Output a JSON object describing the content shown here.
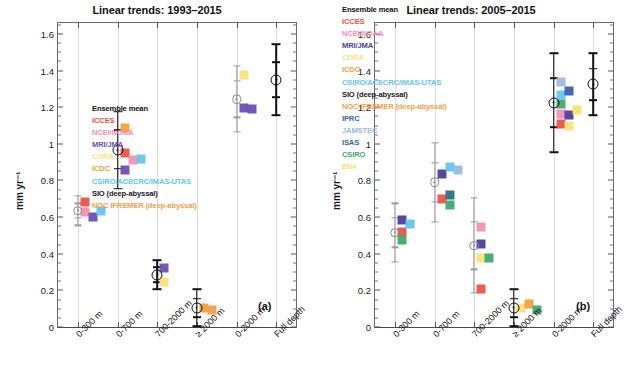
{
  "figure": {
    "ylabel": "mm yr⁻¹",
    "ymin": 0,
    "ymax": 1.66,
    "yticks": [
      "0",
      "0.2",
      "0.4",
      "0.6",
      "0.8",
      "1",
      "1.2",
      "1.4",
      "1.6"
    ],
    "ytick_values": [
      0,
      0.2,
      0.4,
      0.6,
      0.8,
      1.0,
      1.2,
      1.4,
      1.6
    ],
    "categories": [
      "0-300 m",
      "0-700 m",
      "700-2000 m",
      "≥ 2000 m",
      "0-2000 m",
      "Full depth"
    ]
  },
  "palette": {
    "ensemble_mean": "#111111",
    "ICCES": "#e8544a",
    "NCEI_NOAA": "#f48fb4",
    "MRI_JMA": "#6b4fb5",
    "CORA": "#fbe27a",
    "ICDC": "#f2a13c",
    "CSIRO_ACECRC_IMAS_UTAS": "#63c6ee",
    "SIO_deep_abyssal": "#1a1a1a",
    "NOC_IFREMER_deep_abyssal": "#f2a04a",
    "IPRC": "#3b5fae",
    "JAMSTEC": "#9cb9df",
    "ISAS": "#2f6f7e",
    "CSIRO": "#3faa6e",
    "EN4": "#f7e26b"
  },
  "panels": [
    {
      "tag": "(a)",
      "title": "Linear trends: 1993–2015",
      "legend": [
        {
          "label": "Ensemble mean",
          "color": "#111111"
        },
        {
          "label": "ICCES",
          "color": "#e8544a"
        },
        {
          "label": "NCEI/NOAA",
          "color": "#f48fb4"
        },
        {
          "label": "MRI/JMA",
          "color": "#6b4fb5"
        },
        {
          "label": "CORA",
          "color": "#fbe27a"
        },
        {
          "label": "ICDC",
          "color": "#f2a13c"
        },
        {
          "label": "CSIRO/ACECRC/IMAS-UTAS",
          "color": "#63c6ee"
        },
        {
          "label": "SIO (deep-abyssal)",
          "color": "#1a1a1a"
        },
        {
          "label": "NOC IFREMER (deep-abyssal)",
          "color": "#f2a04a"
        }
      ],
      "chart_data": {
        "type": "scatter",
        "title": "Linear trends: 1993–2015",
        "xlabel": "",
        "ylabel": "mm yr⁻¹",
        "ylim": [
          0,
          1.66
        ],
        "grid": true,
        "categories": [
          "0-300 m",
          "0-700 m",
          "700-2000 m",
          "≥ 2000 m",
          "0-2000 m",
          "Full depth"
        ],
        "ensemble_mean": [
          0.635,
          0.965,
          0.285,
          0.105,
          1.245,
          1.35
        ],
        "error_low": [
          0.555,
          0.755,
          0.205,
          0.005,
          1.065,
          1.155
        ],
        "error_high": [
          0.715,
          1.175,
          0.365,
          0.205,
          1.425,
          1.545
        ],
        "inner_low": [
          0.595,
          0.865,
          0.245,
          0.055,
          1.145,
          1.255
        ],
        "inner_high": [
          0.675,
          1.075,
          0.325,
          0.155,
          1.345,
          1.445
        ],
        "error_style": [
          "gray",
          "black",
          "black",
          "black",
          "gray",
          "black"
        ],
        "members": [
          {
            "name": "ICCES",
            "color": "#e8544a",
            "values": [
              0.68,
              0.95,
              null,
              null,
              null,
              null
            ]
          },
          {
            "name": "NCEI/NOAA",
            "color": "#f48fb4",
            "values": [
              0.63,
              0.91,
              null,
              null,
              null,
              null
            ]
          },
          {
            "name": "MRI/JMA",
            "color": "#6b4fb5",
            "values": [
              0.6,
              0.855,
              0.32,
              null,
              1.195,
              null
            ]
          },
          {
            "name": "CORA",
            "color": "#fbe27a",
            "values": [
              null,
              null,
              0.245,
              null,
              1.375,
              null
            ]
          },
          {
            "name": "ICDC",
            "color": "#f2a13c",
            "values": [
              null,
              1.085,
              null,
              0.105,
              null,
              null
            ]
          },
          {
            "name": "CSIRO/ACECRC/IMAS-UTAS",
            "color": "#63c6ee",
            "values": [
              0.635,
              0.915,
              null,
              null,
              null,
              null
            ]
          },
          {
            "name": "NOC IFREMER (deep-abyssal)",
            "color": "#f2a04a",
            "values": [
              null,
              null,
              null,
              0.095,
              null,
              null
            ]
          },
          {
            "name": "SIO (deep-abyssal)",
            "color": "#6b4fb5",
            "values": [
              null,
              null,
              null,
              null,
              1.19,
              null
            ]
          }
        ]
      }
    },
    {
      "tag": "(b)",
      "title": "Linear trends: 2005–2015",
      "legend": [
        {
          "label": "Ensemble mean",
          "color": "#111111"
        },
        {
          "label": "ICCES",
          "color": "#e8544a"
        },
        {
          "label": "NCEI/NOAA",
          "color": "#f48fb4"
        },
        {
          "label": "MRI/JMA",
          "color": "#4a3f9e"
        },
        {
          "label": "CORA",
          "color": "#fbe27a"
        },
        {
          "label": "ICDC",
          "color": "#f2a13c"
        },
        {
          "label": "CSIRO/ACECRC/IMAS-UTAS",
          "color": "#63c6ee"
        },
        {
          "label": "SIO (deep-abyssal)",
          "color": "#1a1a1a"
        },
        {
          "label": "NOC IFREMER (deep-abyssal)",
          "color": "#f2a04a"
        },
        {
          "label": "IPRC",
          "color": "#3b5fae"
        },
        {
          "label": "JAMSTEC",
          "color": "#9cb9df"
        },
        {
          "label": "ISAS",
          "color": "#2f6f7e"
        },
        {
          "label": "CSIRO",
          "color": "#3faa6e"
        },
        {
          "label": "EN4",
          "color": "#f7e26b"
        }
      ],
      "chart_data": {
        "type": "scatter",
        "title": "Linear trends: 2005–2015",
        "xlabel": "",
        "ylabel": "mm yr⁻¹",
        "ylim": [
          0,
          1.66
        ],
        "grid": true,
        "categories": [
          "0-300 m",
          "0-700 m",
          "700-2000 m",
          "≥ 2000 m",
          "0-2000 m",
          "Full depth"
        ],
        "ensemble_mean": [
          0.515,
          0.79,
          0.445,
          0.105,
          1.225,
          1.325
        ],
        "error_low": [
          0.355,
          0.575,
          0.185,
          0.005,
          0.955,
          1.155
        ],
        "error_high": [
          0.675,
          1.005,
          0.705,
          0.205,
          1.495,
          1.495
        ],
        "inner_low": [
          0.435,
          0.685,
          0.315,
          0.055,
          1.09,
          1.24
        ],
        "inner_high": [
          0.595,
          0.895,
          0.575,
          0.155,
          1.36,
          1.41
        ],
        "error_style": [
          "gray",
          "gray",
          "gray",
          "black",
          "black",
          "black"
        ],
        "members": [
          {
            "name": "ICCES",
            "color": "#e8544a",
            "values": [
              0.52,
              0.7,
              0.21,
              null,
              1.11,
              null
            ]
          },
          {
            "name": "NCEI/NOAA",
            "color": "#f48fb4",
            "values": [
              null,
              null,
              0.545,
              null,
              1.165,
              null
            ]
          },
          {
            "name": "MRI/JMA",
            "color": "#4a3f9e",
            "values": [
              0.585,
              0.835,
              0.455,
              null,
              1.16,
              null
            ]
          },
          {
            "name": "CORA",
            "color": "#fbe27a",
            "values": [
              null,
              null,
              0.375,
              0.105,
              1.095,
              null
            ]
          },
          {
            "name": "ICDC",
            "color": "#f2a13c",
            "values": [
              null,
              null,
              null,
              0.125,
              null,
              null
            ]
          },
          {
            "name": "CSIRO/ACECRC/IMAS-UTAS",
            "color": "#63c6ee",
            "values": [
              0.565,
              0.875,
              null,
              null,
              1.265,
              null
            ]
          },
          {
            "name": "IPRC",
            "color": "#3b5fae",
            "values": [
              null,
              null,
              null,
              null,
              1.29,
              null
            ]
          },
          {
            "name": "JAMSTEC",
            "color": "#9cb9df",
            "values": [
              null,
              0.855,
              null,
              null,
              1.34,
              null
            ]
          },
          {
            "name": "ISAS",
            "color": "#2f6f7e",
            "values": [
              null,
              0.72,
              null,
              null,
              null,
              null
            ]
          },
          {
            "name": "CSIRO",
            "color": "#3faa6e",
            "values": [
              0.475,
              0.665,
              0.375,
              0.095,
              1.215,
              null
            ]
          },
          {
            "name": "EN4",
            "color": "#f7e26b",
            "values": [
              null,
              null,
              null,
              null,
              1.185,
              null
            ]
          }
        ]
      }
    }
  ]
}
